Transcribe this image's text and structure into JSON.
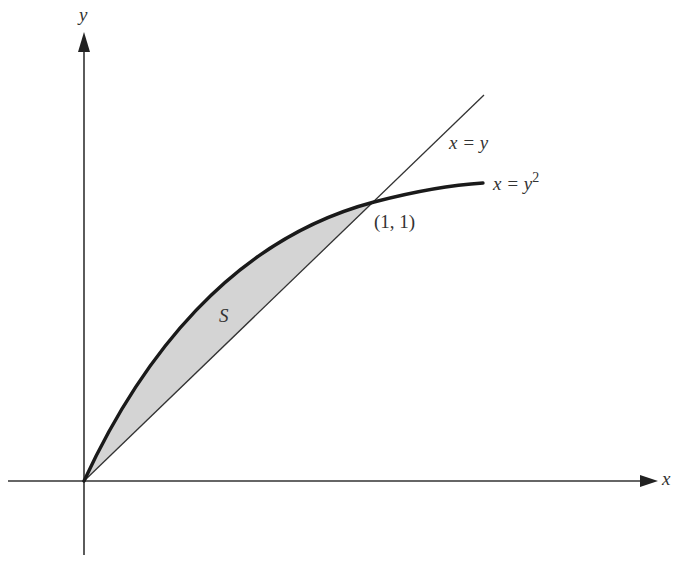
{
  "figure": {
    "axes": {
      "x_label": "x",
      "y_label": "y"
    },
    "curves": [
      {
        "name": "line",
        "equation_lhs": "x = y",
        "label": "x = y"
      },
      {
        "name": "parabola",
        "equation_lhs": "x = y",
        "exponent": "2",
        "label": "x = y^2"
      }
    ],
    "intersection_label": "(1, 1)",
    "region_label": "S",
    "colors": {
      "region_fill": "#d4d4d4",
      "stroke": "#222222",
      "text": "#333333"
    }
  }
}
